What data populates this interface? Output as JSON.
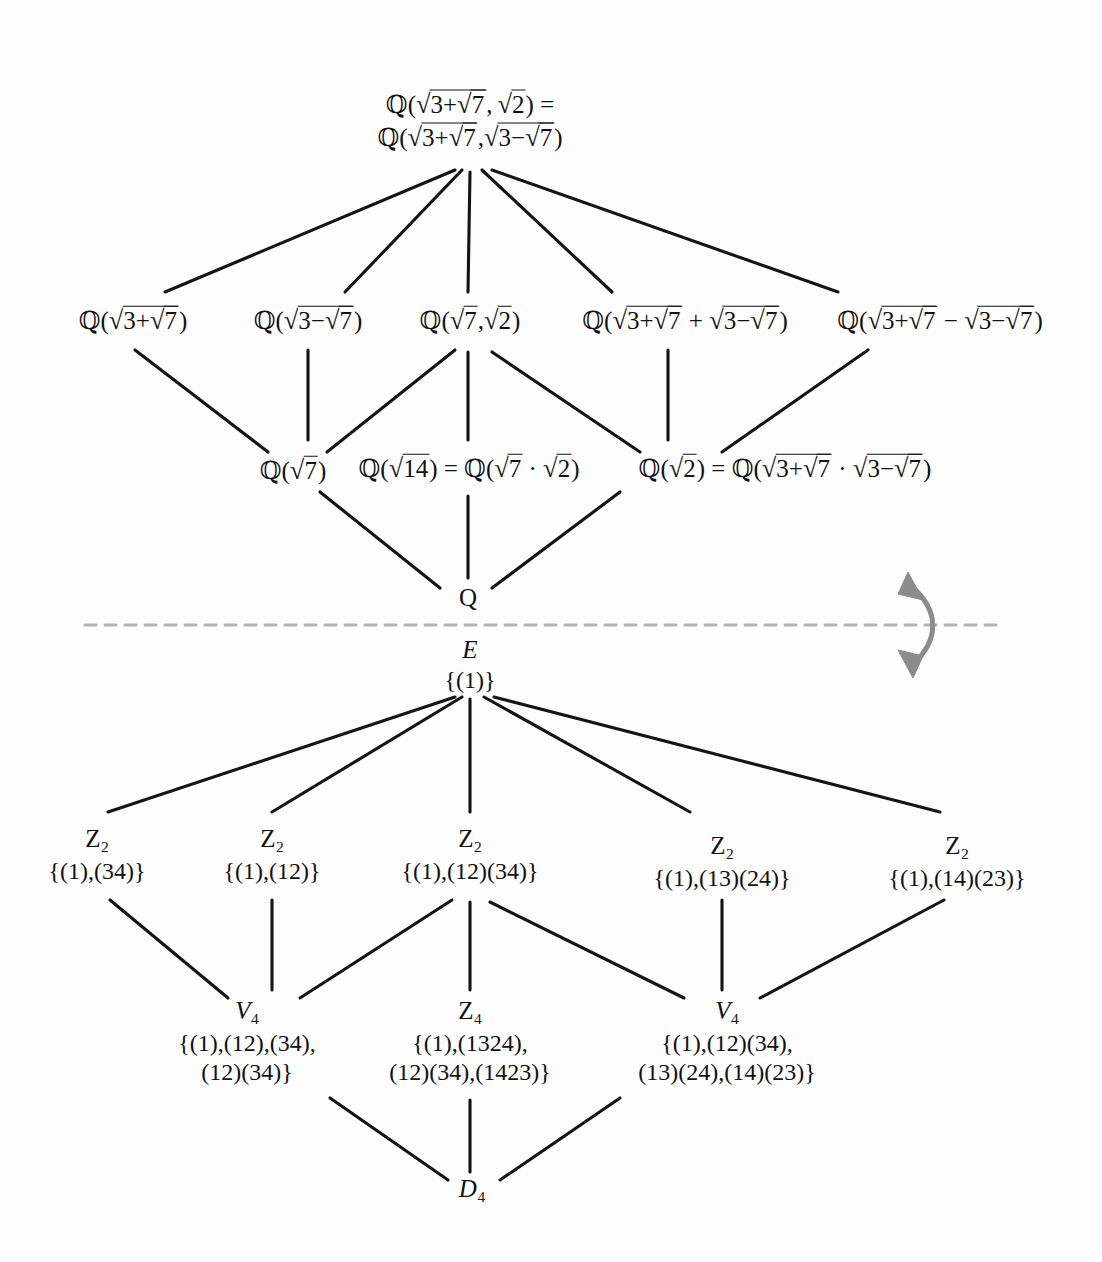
{
  "diagram": {
    "colors": {
      "edge": "#141414",
      "dashed_line": "#b4b4b4",
      "arrow": "#8c8c8c",
      "text": "#121212",
      "background": "#fdfdfd"
    },
    "divider": {
      "style": "dashed",
      "label": "field-group-correspondence-divider"
    },
    "correspondence_arrow": {
      "style": "curved-double-headed",
      "direction": "up-down"
    }
  },
  "fields": {
    "top": {
      "line1": "Q(√(3+√7), √2) =",
      "line2": "Q(√(3+√7), √(3−√7))"
    },
    "row2": [
      {
        "name": "q-sqrt-3-plus-sqrt7",
        "text": "Q(√(3+√7))"
      },
      {
        "name": "q-sqrt-3-minus-sqrt7",
        "text": "Q(√(3−√7))"
      },
      {
        "name": "q-sqrt7-sqrt2",
        "text": "Q(√7, √2)"
      },
      {
        "name": "q-sum",
        "text": "Q(√(3+√7) + √(3−√7))"
      },
      {
        "name": "q-difference",
        "text": "Q(√(3+√7) − √(3−√7))"
      }
    ],
    "row3": [
      {
        "name": "q-sqrt7",
        "text": "Q(√7)"
      },
      {
        "name": "q-sqrt14",
        "text": "Q(√14) = Q(√7 · √2)"
      },
      {
        "name": "q-sqrt2",
        "text": "Q(√2) = Q(√(3+√7) · √(3−√7))"
      }
    ],
    "bottom": {
      "name": "q-rationals",
      "text": "Q"
    }
  },
  "groups": {
    "top": {
      "head": "E",
      "set": "{(1)}"
    },
    "row2": [
      {
        "head": "Z",
        "sub": "2",
        "set": "{(1),(34)}"
      },
      {
        "head": "Z",
        "sub": "2",
        "set": "{(1),(12)}"
      },
      {
        "head": "Z",
        "sub": "2",
        "set": "{(1),(12)(34)}"
      },
      {
        "head": "Z",
        "sub": "2",
        "set": "{(1),(13)(24)}"
      },
      {
        "head": "Z",
        "sub": "2",
        "set": "{(1),(14)(23)}"
      }
    ],
    "row3": [
      {
        "head": "V",
        "sub": "4",
        "set_line1": "{(1),(12),(34),",
        "set_line2": "(12)(34)}"
      },
      {
        "head": "Z",
        "sub": "4",
        "set_line1": "{(1),(1324),",
        "set_line2": "(12)(34),(1423)}"
      },
      {
        "head": "V",
        "sub": "4",
        "set_line1": "{(1),(12)(34),",
        "set_line2": "(13)(24),(14)(23)}"
      }
    ],
    "bottom": {
      "head": "D",
      "sub": "4"
    }
  }
}
